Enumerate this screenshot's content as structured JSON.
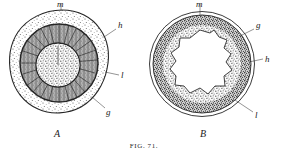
{
  "figure": {
    "caption": "FIG. 71.",
    "background_color": "#ffffff",
    "ink_color": "#262626",
    "panels": [
      {
        "id": "A",
        "panel_label": "A",
        "description": "cross-section with solid stippled central core surrounded by dark radial fibrous zone and outer stippled cortex",
        "labels": [
          {
            "key": "m",
            "text": "m",
            "position": "top"
          },
          {
            "key": "h",
            "text": "h",
            "position": "upper-right"
          },
          {
            "key": "l",
            "text": "l",
            "position": "mid-right"
          },
          {
            "key": "g",
            "text": "g",
            "position": "lower-right"
          }
        ]
      },
      {
        "id": "B",
        "panel_label": "B",
        "description": "cross-section with open irregular central lumen surrounded by pale stippled layer, dark granular zone and thin outer membrane",
        "labels": [
          {
            "key": "m",
            "text": "m",
            "position": "top"
          },
          {
            "key": "g",
            "text": "g",
            "position": "upper-right"
          },
          {
            "key": "h",
            "text": "h",
            "position": "mid-right"
          },
          {
            "key": "l",
            "text": "l",
            "position": "lower-right"
          }
        ]
      }
    ]
  }
}
